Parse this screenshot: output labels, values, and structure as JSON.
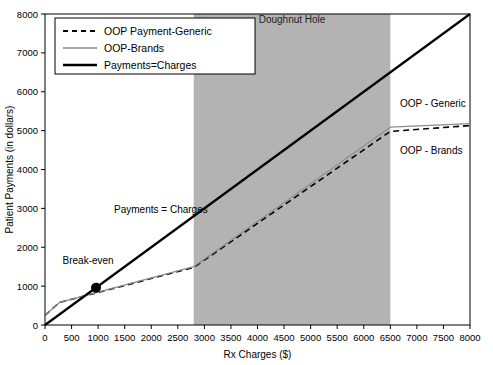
{
  "chart_data": {
    "type": "line",
    "title": "",
    "xlabel": "Rx Charges ($)",
    "ylabel": "Patient Payments (in dollars)",
    "xlim": [
      0,
      8000
    ],
    "ylim": [
      0,
      8000
    ],
    "xticks": [
      0,
      500,
      1000,
      1500,
      2000,
      2500,
      3000,
      3500,
      4000,
      4500,
      5000,
      5500,
      6000,
      6500,
      7000,
      7500,
      8000
    ],
    "yticks": [
      0,
      1000,
      2000,
      3000,
      4000,
      5000,
      6000,
      7000,
      8000
    ],
    "xtick_labels": [
      "0",
      "500",
      "1000",
      "1500",
      "2000",
      "2500",
      "3000",
      "3500",
      "4000",
      "4500",
      "5000",
      "5500",
      "6000",
      "6500",
      "7000",
      "7500",
      "8000"
    ],
    "ytick_labels": [
      "0",
      "1000",
      "2000",
      "3000",
      "4000",
      "5000",
      "6000",
      "7000",
      "8000"
    ],
    "grid": false,
    "legend_position": "top-left",
    "series": [
      {
        "name": "OOP Payment-Generic",
        "style": "dashed",
        "color": "#000000",
        "width": 1.6,
        "points": [
          [
            0,
            250
          ],
          [
            275,
            580
          ],
          [
            2800,
            1480
          ],
          [
            6500,
            4980
          ],
          [
            8000,
            5130
          ]
        ]
      },
      {
        "name": "OOP-Brands",
        "style": "solid",
        "color": "#8a8a8a",
        "width": 1.2,
        "points": [
          [
            0,
            250
          ],
          [
            275,
            580
          ],
          [
            2800,
            1500
          ],
          [
            6500,
            5090
          ],
          [
            8000,
            5180
          ]
        ]
      },
      {
        "name": "Payments=Charges",
        "style": "solid",
        "color": "#000000",
        "width": 2.2,
        "points": [
          [
            0,
            0
          ],
          [
            8000,
            8000
          ]
        ]
      }
    ],
    "shaded_regions": [
      {
        "label": "Doughnut Hole",
        "x_start": 2800,
        "x_end": 6500,
        "color": "#b3b3b3",
        "label_x": 4650,
        "label_y": 7760
      }
    ],
    "markers": [
      {
        "label": "Break-even",
        "x": 960,
        "y": 960,
        "shape": "circle",
        "color": "#000000",
        "size": 5
      }
    ],
    "annotations": [
      {
        "text": "Payments = Charges",
        "x": 1300,
        "y": 2880,
        "anchor": "start"
      },
      {
        "text": "Break-even",
        "x": 330,
        "y": 1560,
        "anchor": "start"
      },
      {
        "text": "OOP - Generic",
        "x": 6680,
        "y": 5620,
        "anchor": "start"
      },
      {
        "text": "OOP - Brands",
        "x": 6680,
        "y": 4400,
        "anchor": "start"
      }
    ],
    "legend_entries": [
      {
        "label": "OOP Payment-Generic",
        "style": "dashed",
        "color": "#000000",
        "width": 1.8
      },
      {
        "label": "OOP-Brands",
        "style": "solid",
        "color": "#8a8a8a",
        "width": 1.3
      },
      {
        "label": "Payments=Charges",
        "style": "solid",
        "color": "#000000",
        "width": 2.4
      }
    ]
  }
}
